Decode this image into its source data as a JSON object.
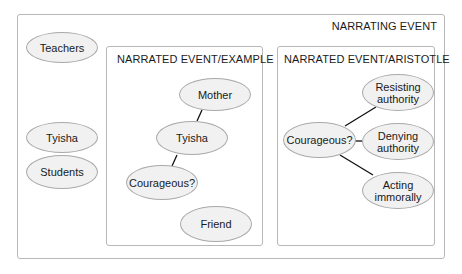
{
  "narrating_event": {
    "title": "NARRATING EVENT",
    "nodes": [
      "Teachers",
      "Tyisha",
      "Students"
    ]
  },
  "narrated_example": {
    "title": "NARRATED EVENT/EXAMPLE",
    "nodes": [
      "Mother",
      "Tyisha",
      "Courageous?",
      "Friend"
    ],
    "edges": [
      [
        "Mother",
        "Tyisha"
      ],
      [
        "Tyisha",
        "Courageous?"
      ]
    ]
  },
  "narrated_aristotle": {
    "title": "NARRATED EVENT/ARISTOTLE",
    "nodes": [
      "Courageous?",
      "Resisting authority",
      "Denying authority",
      "Acting immorally"
    ],
    "edges": [
      [
        "Courageous?",
        "Resisting authority"
      ],
      [
        "Courageous?",
        "Denying authority"
      ],
      [
        "Courageous?",
        "Acting immorally"
      ]
    ]
  }
}
